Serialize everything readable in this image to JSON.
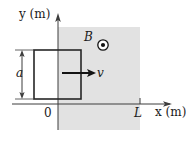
{
  "figure": {
    "type": "physics-diagram",
    "axes": {
      "y_label": "y (m)",
      "x_label": "x (m)",
      "origin_label": "0",
      "x_tick_label": "L"
    },
    "labels": {
      "side_length": "a",
      "velocity": "v",
      "field": "B"
    },
    "icons": {
      "field_out_of_page": "circle-dot-icon",
      "y_axis_arrow": "arrow-up-icon",
      "x_axis_arrow": "arrow-right-icon",
      "velocity_arrow": "arrow-right-icon",
      "dimension_arrow": "double-arrow-vertical-icon"
    },
    "colors": {
      "field_region_fill": "#e2e2e2",
      "loop_stroke": "#262626",
      "axis_stroke": "#3d3d3d",
      "text": "#1a1a1a",
      "background": "#ffffff"
    },
    "geometry": {
      "axis_origin_px": [
        58,
        104
      ],
      "field_region_px": [
        58,
        27,
        140,
        130
      ],
      "loop_rect_px": [
        34,
        50,
        81,
        99
      ],
      "L_tick_px": 140,
      "velocity_arrow_px": [
        62,
        73,
        95,
        73
      ],
      "dimension_arrow_px": [
        22,
        50,
        22,
        99
      ],
      "field_symbol_px": [
        103,
        45
      ]
    }
  }
}
